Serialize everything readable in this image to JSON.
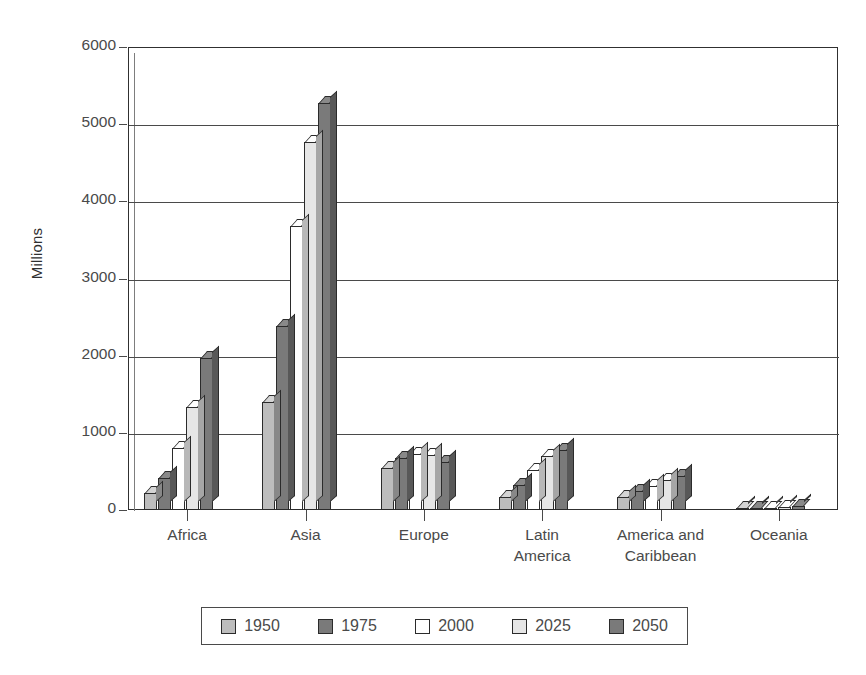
{
  "chart_data": {
    "type": "bar",
    "title": "",
    "subtitle": "",
    "xlabel": "",
    "ylabel": "Millions",
    "ylim": [
      0,
      6000
    ],
    "ytick_values": [
      0,
      1000,
      2000,
      3000,
      4000,
      5000,
      6000
    ],
    "ytick_labels": [
      "0",
      "1000",
      "2000",
      "3000",
      "4000",
      "5000",
      "6000"
    ],
    "grid": "horizontal",
    "legend_position": "below-plot",
    "categories": [
      "Africa",
      "Asia",
      "Europe",
      "Latin\nAmerica",
      "America and\nCaribbean",
      "Oceania"
    ],
    "category_lines": [
      [
        "Africa"
      ],
      [
        "Asia"
      ],
      [
        "Europe"
      ],
      [
        "Latin",
        "America"
      ],
      [
        "America and",
        "Caribbean"
      ],
      [
        "Oceania"
      ]
    ],
    "series": [
      {
        "name": "1950",
        "color": "#bdbdbd",
        "values": [
          224,
          1402,
          549,
          167,
          172,
          13
        ]
      },
      {
        "name": "1975",
        "color": "#7a7a7a",
        "values": [
          416,
          2379,
          676,
          322,
          243,
          21
        ]
      },
      {
        "name": "2000",
        "color": "#ffffff",
        "values": [
          805,
          3683,
          729,
          519,
          314,
          31
        ]
      },
      {
        "name": "2025",
        "color": "#e6e6e6",
        "values": [
          1331,
          4764,
          715,
          697,
          383,
          41
        ]
      },
      {
        "name": "2050",
        "color": "#7a7a7a",
        "values": [
          1966,
          5268,
          628,
          774,
          438,
          46
        ]
      }
    ]
  },
  "legend": {
    "entries": [
      {
        "label": "1950",
        "color": "#bdbdbd"
      },
      {
        "label": "1975",
        "color": "#7a7a7a"
      },
      {
        "label": "2000",
        "color": "#ffffff"
      },
      {
        "label": "2025",
        "color": "#e6e6e6"
      },
      {
        "label": "2050",
        "color": "#7a7a7a"
      }
    ]
  }
}
